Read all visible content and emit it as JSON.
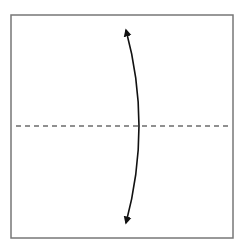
{
  "diagram": {
    "type": "origami-fold-step",
    "colors": {
      "background": "#ffffff",
      "paper_border": "#777777",
      "fold_line": "#222222",
      "arrow": "#111111"
    },
    "paper": {
      "x": 11,
      "y": 15,
      "width": 222,
      "height": 223
    },
    "fold_line": {
      "style": "dashed",
      "y": 126,
      "x1": 16,
      "x2": 232
    },
    "arrow": {
      "style": "double-headed-curved",
      "top": [
        124,
        24
      ],
      "bottom": [
        124,
        229
      ],
      "bulge_x": 138
    }
  }
}
